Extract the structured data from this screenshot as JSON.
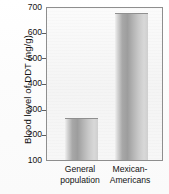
{
  "chart_data": {
    "type": "bar",
    "title": "",
    "xlabel": "",
    "ylabel": "Blood level of DDT (ng/g)",
    "categories": [
      "General population",
      "Mexican-Americans"
    ],
    "category_lines": [
      [
        "General",
        "population"
      ],
      [
        "Mexican-",
        "Americans"
      ]
    ],
    "values": [
      265,
      680
    ],
    "units": "ng/g",
    "ylim": [
      100,
      700
    ],
    "yticks": [
      700,
      600,
      500,
      400,
      300,
      200,
      100
    ],
    "ytick_labels": [
      "700",
      "600",
      "500",
      "400",
      "300",
      "200",
      "100"
    ],
    "grid": false,
    "legend": null,
    "colors": {
      "bar_fill_light": "#d8d8d8",
      "bar_fill_dark": "#9d9d9d",
      "frame": "#8e8e8e",
      "text": "#131313",
      "plot_background": "#f7f7f7"
    }
  }
}
